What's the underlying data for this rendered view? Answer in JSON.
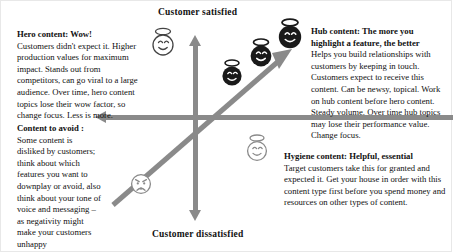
{
  "diagram": {
    "title_top": "Customer satisfied",
    "title_bottom": "Customer dissatisfied",
    "colors": {
      "axis": "#8a8a8a",
      "face_dark": "#1a1a1a",
      "face_gray": "#8a8a8a",
      "face_light": "#ffffff",
      "text": "#111111",
      "background": "#ffffff"
    }
  },
  "blocks": {
    "hero": {
      "heading": "Hero content: Wow!",
      "body": "Customers didn't expect it. Higher production values for maximum impact. Stands out from competitors, can go viral to a large audience.  Over time, hero content topics lose their wow factor, so change focus. Less is more."
    },
    "avoid": {
      "heading": "Content to avoid :",
      "body": "Some content is disliked by customers; think about which features you want to downplay or avoid, also think about your tone of voice and messaging – as negativity might make your customers unhappy"
    },
    "hub": {
      "heading": "Hub content: The more you highlight a feature, the better",
      "body": "Helps you build relationships with customers by keeping in touch. Customers expect to receive this content. Can be newsy, topical. Work on hub content before hero content. Steady volume. Over time hub topics may lose their performance value. Change focus."
    },
    "hygiene": {
      "heading": "Hygiene content: Helpful, essential",
      "body": "Target customers take this for granted and expected it. Get your house in order with this content type first before you spend money and resources on other types of content."
    }
  },
  "faces": [
    {
      "name": "hero-angel-face",
      "style": "light",
      "expression": "smiling-halo"
    },
    {
      "name": "hub-angel-face-1",
      "style": "dark",
      "expression": "smiling-halo"
    },
    {
      "name": "hub-angel-face-2",
      "style": "dark",
      "expression": "smiling-halo"
    },
    {
      "name": "hub-angel-face-3",
      "style": "dark",
      "expression": "smiling-halo"
    },
    {
      "name": "hygiene-angel-face",
      "style": "gray",
      "expression": "smiling-halo"
    },
    {
      "name": "avoid-angry-face",
      "style": "gray",
      "expression": "angry-frown"
    }
  ],
  "axes": {
    "vertical": "satisfaction-axis",
    "horizontal": "feature-axis",
    "diagonal": "growth-arrow"
  }
}
